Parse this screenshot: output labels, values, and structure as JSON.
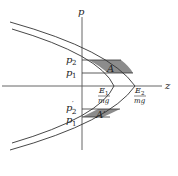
{
  "diagram": {
    "axes": {
      "vertical_label": "p",
      "horizontal_label": "z"
    },
    "curves": [
      {
        "name": "inner-parabola",
        "vertex_label": "E1/mg"
      },
      {
        "name": "outer-parabola",
        "vertex_label": "E2/mg"
      }
    ],
    "tick_labels": {
      "p2": {
        "base": "p",
        "sub": "2",
        "prime": ""
      },
      "p1": {
        "base": "p",
        "sub": "1",
        "prime": ""
      },
      "p2_prime": {
        "base": "p",
        "sub": "2",
        "prime": "′"
      },
      "p1_prime": {
        "base": "p",
        "sub": "1",
        "prime": "′"
      }
    },
    "vertex_labels": {
      "e1": {
        "num_base": "E",
        "num_sub": "1",
        "den": "mg"
      },
      "e2": {
        "num_base": "E",
        "num_sub": "2",
        "den": "mg"
      }
    },
    "regions": {
      "upper": {
        "label": "A"
      },
      "lower": {
        "label": "A′"
      }
    },
    "colors": {
      "line": "#333333",
      "shade": "#8c8c8c",
      "axis": "#555555"
    }
  }
}
